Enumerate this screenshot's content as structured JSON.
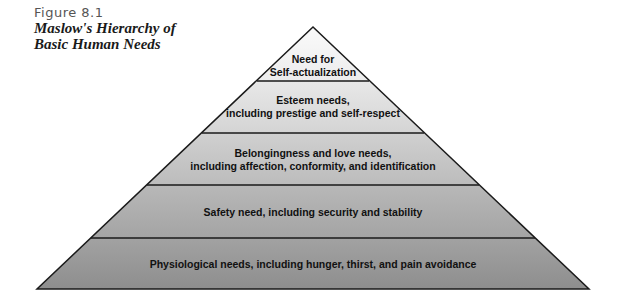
{
  "figure": {
    "label": "Figure 8.1",
    "title_line1": "Maslow's Hierarchy of",
    "title_line2": "Basic Human Needs"
  },
  "pyramid": {
    "levels": [
      {
        "line1": "Need for",
        "line2": "Self-actualization",
        "fill": "#f2f2f2"
      },
      {
        "line1": "Esteem needs,",
        "line2": "including prestige and self-respect",
        "fill": "#dcdcdc"
      },
      {
        "line1": "Belongingness and love needs,",
        "line2": "including affection, conformity, and identification",
        "fill": "#c4c4c4"
      },
      {
        "line1": "Safety need, including security and stability",
        "line2": "",
        "fill": "#aaaaaa"
      },
      {
        "line1": "Physiological needs, including hunger, thirst, and pain avoidance",
        "line2": "",
        "fill": "#979797"
      }
    ]
  }
}
